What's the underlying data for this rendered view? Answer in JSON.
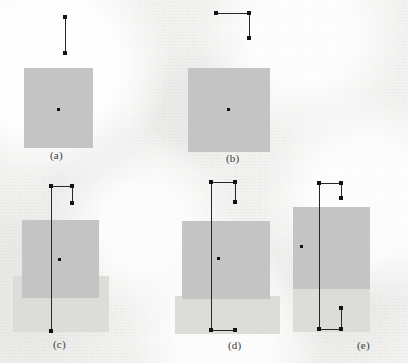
{
  "figure": {
    "width": 408,
    "height": 363,
    "background_color": "#f3f3f1",
    "panel_count": 5
  },
  "colors": {
    "paper": "#f3f3f1",
    "region_dark": "#c4c4c4",
    "region_light": "#dcdcd9",
    "line": "#272727",
    "marker": "#121212",
    "label_text": "#3b3b3b"
  },
  "panels": [
    {
      "id": "a",
      "label": "(a)",
      "label_x": 50,
      "label_y": 149,
      "regions": [
        {
          "name": "main-region",
          "x": 24,
          "y": 68,
          "w": 69,
          "h": 80,
          "shade": "dark"
        }
      ],
      "segments": [
        {
          "name": "vertical-gauge",
          "orientation": "v",
          "x": 65,
          "y": 17,
          "length": 36
        }
      ],
      "markers": [
        {
          "name": "gauge-endpoint-top",
          "x": 65,
          "y": 17
        },
        {
          "name": "gauge-endpoint-bottom",
          "x": 65,
          "y": 53
        },
        {
          "name": "region-centroid",
          "x": 58,
          "y": 109,
          "center": true
        }
      ]
    },
    {
      "id": "b",
      "label": "(b)",
      "label_x": 226,
      "label_y": 152,
      "regions": [
        {
          "name": "main-region",
          "x": 188,
          "y": 68,
          "w": 82,
          "h": 84,
          "shade": "dark"
        }
      ],
      "segments": [
        {
          "name": "horizontal-gauge",
          "orientation": "h",
          "x": 216,
          "y": 13,
          "length": 33
        },
        {
          "name": "vertical-gauge",
          "orientation": "v",
          "x": 249,
          "y": 13,
          "length": 25
        }
      ],
      "markers": [
        {
          "name": "gauge-endpoint-left",
          "x": 216,
          "y": 13
        },
        {
          "name": "gauge-corner",
          "x": 249,
          "y": 13
        },
        {
          "name": "gauge-endpoint-bottom",
          "x": 249,
          "y": 38
        },
        {
          "name": "region-centroid",
          "x": 228,
          "y": 109,
          "center": true
        }
      ]
    },
    {
      "id": "c",
      "label": "(c)",
      "label_x": 53,
      "label_y": 338,
      "regions": [
        {
          "name": "lower-region",
          "x": 13,
          "y": 300,
          "w": 96,
          "h": 32,
          "shade": "light"
        },
        {
          "name": "lower-region-body",
          "x": 13,
          "y": 276,
          "w": 96,
          "h": 56,
          "shade": "light"
        },
        {
          "name": "main-region",
          "x": 22,
          "y": 220,
          "w": 77,
          "h": 78,
          "shade": "dark"
        }
      ],
      "segments": [
        {
          "name": "horizontal-gauge",
          "orientation": "h",
          "x": 51,
          "y": 186,
          "length": 21
        },
        {
          "name": "short-vertical-gauge",
          "orientation": "v",
          "x": 72,
          "y": 186,
          "length": 17
        },
        {
          "name": "long-vertical-gauge",
          "orientation": "v",
          "x": 51,
          "y": 186,
          "length": 145
        }
      ],
      "markers": [
        {
          "name": "gauge-endpoint-left",
          "x": 51,
          "y": 186
        },
        {
          "name": "gauge-corner",
          "x": 72,
          "y": 186
        },
        {
          "name": "gauge-endpoint-short-bottom",
          "x": 72,
          "y": 203
        },
        {
          "name": "gauge-endpoint-long-bottom",
          "x": 51,
          "y": 331
        },
        {
          "name": "region-centroid",
          "x": 59,
          "y": 259,
          "center": true
        }
      ]
    },
    {
      "id": "d",
      "label": "(d)",
      "label_x": 228,
      "label_y": 339,
      "regions": [
        {
          "name": "lower-region",
          "x": 175,
          "y": 296,
          "w": 105,
          "h": 38,
          "shade": "light"
        },
        {
          "name": "main-region",
          "x": 182,
          "y": 221,
          "w": 88,
          "h": 78,
          "shade": "dark"
        }
      ],
      "segments": [
        {
          "name": "top-horizontal-gauge",
          "orientation": "h",
          "x": 211,
          "y": 182,
          "length": 24
        },
        {
          "name": "short-vertical-gauge",
          "orientation": "v",
          "x": 235,
          "y": 182,
          "length": 20
        },
        {
          "name": "long-vertical-gauge",
          "orientation": "v",
          "x": 211,
          "y": 182,
          "length": 148
        },
        {
          "name": "bottom-horizontal-gauge",
          "orientation": "h",
          "x": 211,
          "y": 330,
          "length": 24
        }
      ],
      "markers": [
        {
          "name": "gauge-endpoint-top-left",
          "x": 211,
          "y": 182
        },
        {
          "name": "gauge-corner-top-right",
          "x": 235,
          "y": 182
        },
        {
          "name": "gauge-endpoint-short-bottom",
          "x": 235,
          "y": 202
        },
        {
          "name": "gauge-endpoint-bottom-left",
          "x": 211,
          "y": 330
        },
        {
          "name": "gauge-endpoint-bottom-right",
          "x": 235,
          "y": 330
        },
        {
          "name": "region-centroid",
          "x": 218,
          "y": 258,
          "center": true
        }
      ]
    },
    {
      "id": "e",
      "label": "(e)",
      "label_x": 357,
      "label_y": 339,
      "regions": [
        {
          "name": "lower-region",
          "x": 293,
          "y": 288,
          "w": 77,
          "h": 44,
          "shade": "light"
        },
        {
          "name": "main-region",
          "x": 293,
          "y": 207,
          "w": 77,
          "h": 82,
          "shade": "dark"
        }
      ],
      "segments": [
        {
          "name": "top-horizontal-gauge",
          "orientation": "h",
          "x": 319,
          "y": 183,
          "length": 22
        },
        {
          "name": "short-vertical-gauge",
          "orientation": "v",
          "x": 341,
          "y": 183,
          "length": 15
        },
        {
          "name": "long-vertical-gauge",
          "orientation": "v",
          "x": 319,
          "y": 183,
          "length": 146
        },
        {
          "name": "bottom-horizontal-gauge",
          "orientation": "h",
          "x": 319,
          "y": 329,
          "length": 22
        },
        {
          "name": "bottom-short-vertical-gauge",
          "orientation": "v",
          "x": 341,
          "y": 308,
          "length": 21
        }
      ],
      "markers": [
        {
          "name": "gauge-endpoint-top-left",
          "x": 319,
          "y": 183
        },
        {
          "name": "gauge-corner-top-right",
          "x": 341,
          "y": 183
        },
        {
          "name": "gauge-endpoint-short-bottom",
          "x": 341,
          "y": 198
        },
        {
          "name": "gauge-endpoint-bottom-left",
          "x": 319,
          "y": 329
        },
        {
          "name": "gauge-endpoint-bottom-right",
          "x": 341,
          "y": 329
        },
        {
          "name": "gauge-endpoint-lower-mid",
          "x": 341,
          "y": 308
        },
        {
          "name": "region-centroid",
          "x": 301,
          "y": 246,
          "center": true
        }
      ]
    }
  ]
}
